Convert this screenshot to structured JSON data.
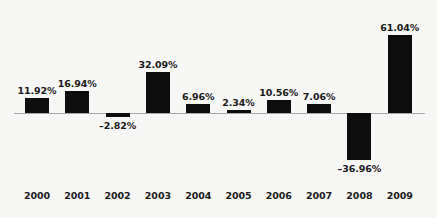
{
  "chart_data": {
    "type": "bar",
    "title": "",
    "subtitle": "",
    "xlabel": "",
    "ylabel": "",
    "categories": [
      "2000",
      "2001",
      "2002",
      "2003",
      "2004",
      "2005",
      "2006",
      "2007",
      "2008",
      "2009"
    ],
    "values": [
      11.92,
      16.94,
      -2.82,
      32.09,
      6.96,
      2.34,
      10.56,
      7.06,
      -36.96,
      61.04
    ],
    "data_labels": [
      "11.92%",
      "16.94%",
      "–2.82%",
      "32.09%",
      "6.96%",
      "2.34%",
      "10.56%",
      "7.06%",
      "–36.96%",
      "61.04%"
    ],
    "series": [
      {
        "name": "",
        "values": [
          11.92,
          16.94,
          -2.82,
          32.09,
          6.96,
          2.34,
          10.56,
          7.06,
          -36.96,
          61.04
        ]
      }
    ],
    "ylim": [
      -40,
      65
    ],
    "grid": false,
    "legend": false,
    "legend_position": "none",
    "bar_color": "#0d0d0d",
    "background_color": "#f7f7f6",
    "axis_color": "#a9a9a9",
    "text_color": "#1a1a1a",
    "value_suffix": "%",
    "negative_sign": "–",
    "baseline": 0
  },
  "layout": {
    "baseline_y_px": 113,
    "px_per_unit": 1.278,
    "bar_width_px": 24,
    "first_bar_center_px": 37,
    "bar_spacing_px": 40.3
  }
}
